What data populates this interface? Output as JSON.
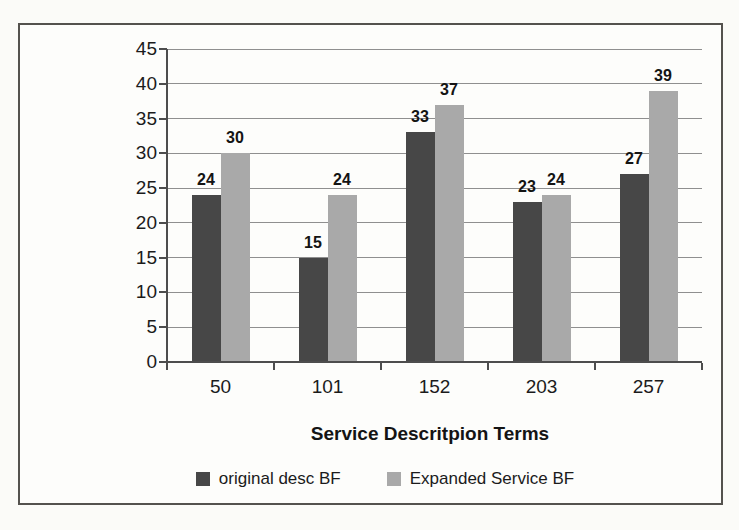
{
  "figure": {
    "background": "#fdfdfb",
    "frame_border_color": "#54524e",
    "gridline_color": "#8f8f8f",
    "axis_color": "#4d4d4d",
    "text_color": "#141414"
  },
  "chart_data": {
    "type": "bar",
    "title": "",
    "categories": [
      "50",
      "101",
      "152",
      "203",
      "257"
    ],
    "series": [
      {
        "name": "original desc BF",
        "color": "#474747",
        "values": [
          24,
          15,
          33,
          23,
          27
        ]
      },
      {
        "name": "Expanded Service BF",
        "color": "#a9a9a9",
        "values": [
          30,
          24,
          37,
          24,
          39
        ]
      }
    ],
    "xlabel": "Service Descritpion Terms",
    "ylabel": "Matching Business Functions",
    "ylim": [
      0,
      45
    ],
    "ytick_step": 5,
    "grid": "horizontal",
    "legend_position": "bottom",
    "data_labels": true
  }
}
